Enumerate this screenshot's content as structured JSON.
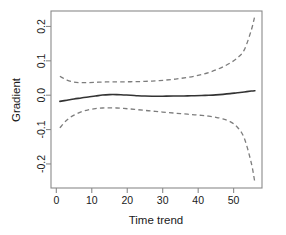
{
  "chart_data": {
    "type": "line",
    "title": "",
    "subtitle": "",
    "xlabel": "Time trend",
    "ylabel": "Gradient",
    "xlim": [
      -1.5,
      58
    ],
    "ylim": [
      -0.27,
      0.245
    ],
    "xticks": [
      0,
      10,
      20,
      30,
      40,
      50
    ],
    "yticks": [
      -0.2,
      -0.1,
      0.0,
      0.1,
      0.2
    ],
    "xtick_labels": [
      "0",
      "10",
      "20",
      "30",
      "40",
      "50"
    ],
    "ytick_labels": [
      "-0.2",
      "-0.1",
      "0.0",
      "0.1",
      "0.2"
    ],
    "grid": false,
    "legend": "none",
    "box": "full",
    "series": [
      {
        "name": "Estimated gradient",
        "style": "solid",
        "color": "#333333",
        "x": [
          1,
          3,
          5,
          7,
          9,
          11,
          13,
          15,
          17,
          19,
          21,
          23,
          25,
          27,
          29,
          31,
          33,
          35,
          37,
          39,
          41,
          43,
          45,
          47,
          49,
          51,
          53,
          55,
          56
        ],
        "values": [
          -0.018,
          -0.0145,
          -0.011,
          -0.008,
          -0.005,
          -0.0025,
          0.0005,
          0.0018,
          0.0018,
          0.0008,
          0.0,
          -0.0015,
          -0.0025,
          -0.003,
          -0.003,
          -0.0028,
          -0.0025,
          -0.0022,
          -0.002,
          -0.0015,
          -0.0008,
          0.0,
          0.001,
          0.0025,
          0.0045,
          0.007,
          0.0095,
          0.012,
          0.013
        ]
      },
      {
        "name": "Upper confidence band",
        "style": "dashed",
        "color": "#7d7d7d",
        "x": [
          1,
          3,
          5,
          7,
          9,
          11,
          13,
          15,
          17,
          19,
          21,
          23,
          25,
          27,
          29,
          31,
          33,
          35,
          37,
          39,
          41,
          43,
          45,
          47,
          49,
          51,
          53,
          55,
          56
        ],
        "values": [
          0.055,
          0.044,
          0.038,
          0.0365,
          0.0368,
          0.0375,
          0.0382,
          0.0388,
          0.039,
          0.039,
          0.0392,
          0.0395,
          0.0402,
          0.0412,
          0.0425,
          0.0442,
          0.0462,
          0.0488,
          0.0518,
          0.0555,
          0.0602,
          0.066,
          0.0735,
          0.0825,
          0.0935,
          0.108,
          0.132,
          0.19,
          0.232
        ]
      },
      {
        "name": "Lower confidence band",
        "style": "dashed",
        "color": "#7d7d7d",
        "x": [
          1,
          3,
          5,
          7,
          9,
          11,
          13,
          15,
          17,
          19,
          21,
          23,
          25,
          27,
          29,
          31,
          33,
          35,
          37,
          39,
          41,
          43,
          45,
          47,
          49,
          51,
          53,
          55,
          56
        ],
        "values": [
          -0.095,
          -0.072,
          -0.058,
          -0.0485,
          -0.0425,
          -0.039,
          -0.0372,
          -0.0368,
          -0.0372,
          -0.0385,
          -0.0402,
          -0.0422,
          -0.0442,
          -0.0462,
          -0.0482,
          -0.05,
          -0.0518,
          -0.0535,
          -0.0552,
          -0.057,
          -0.0588,
          -0.061,
          -0.0642,
          -0.069,
          -0.077,
          -0.0925,
          -0.125,
          -0.198,
          -0.255
        ]
      }
    ]
  },
  "axes": {
    "y_title": "Gradient",
    "x_title": "Time trend"
  }
}
